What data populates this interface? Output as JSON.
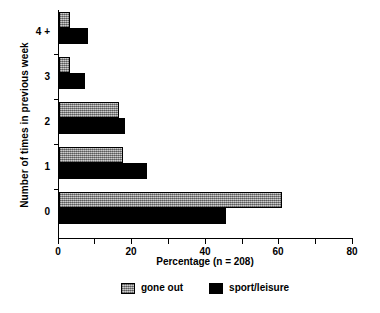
{
  "chart_data": {
    "type": "bar",
    "orientation": "horizontal",
    "title": "",
    "xlabel": "Percentage (n = 208)",
    "ylabel": "Number of times in previous week",
    "categories": [
      "0",
      "1",
      "2",
      "3",
      "4 +"
    ],
    "series": [
      {
        "name": "gone out",
        "color": "#a6a6a6",
        "values": [
          61,
          17.5,
          16.5,
          3,
          3
        ]
      },
      {
        "name": "sport/leisure",
        "color": "#000000",
        "values": [
          45.5,
          24,
          18,
          7,
          8
        ]
      }
    ],
    "xlim": [
      0,
      80
    ],
    "xticks": [
      0,
      20,
      40,
      60,
      80
    ],
    "grid": false,
    "legend_position": "bottom-center"
  },
  "axes": {
    "x_tick_labels": [
      "0",
      "20",
      "40",
      "60",
      "80"
    ],
    "y_tick_labels": [
      "4 +",
      "3",
      "2",
      "1",
      "0"
    ],
    "x_title": "Percentage (n = 208)",
    "y_title": "Number of times in previous week"
  },
  "legend": {
    "items": [
      {
        "label": "gone out",
        "swatch": "gray-hatched-swatch"
      },
      {
        "label": "sport/leisure",
        "swatch": "black-swatch"
      }
    ]
  }
}
